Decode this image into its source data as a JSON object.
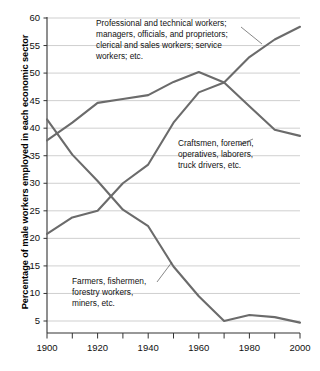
{
  "chart_data": {
    "type": "line",
    "title": "",
    "subtitle": "",
    "xlabel": "",
    "ylabel": "Percentage of male workers employed in each economic sector",
    "xlim": [
      1900,
      2000
    ],
    "ylim": [
      0,
      60
    ],
    "grid": true,
    "legend_position": "inline-annotations",
    "x": [
      1900,
      1910,
      1920,
      1930,
      1940,
      1950,
      1960,
      1970,
      1980,
      1990,
      2000
    ],
    "xticks": [
      1900,
      1920,
      1940,
      1960,
      1980,
      2000
    ],
    "xtick_labels": [
      "1900",
      "1920",
      "1940",
      "1960",
      "1980",
      "2000"
    ],
    "xminor_ticks": [
      1910,
      1930,
      1950,
      1970,
      1990
    ],
    "yticks": [
      5,
      10,
      15,
      20,
      25,
      30,
      35,
      40,
      45,
      50,
      55,
      60
    ],
    "ytick_labels": [
      "5",
      "10",
      "15",
      "20",
      "25",
      "30",
      "35",
      "40",
      "45",
      "50",
      "55",
      "60"
    ],
    "line_color": "#6b6b6b",
    "grid_color": "#c9c9c9",
    "axis_color": "#333333",
    "series": [
      {
        "name": "white-collar",
        "label": "Professional and technical workers;\nmanagers, officials, and proprietors;\nclerical and sales workers; service\nworkers; etc.",
        "values": [
          20.8,
          23.8,
          25.0,
          30.0,
          33.4,
          41.0,
          46.5,
          48.3,
          52.9,
          56.1,
          58.4
        ]
      },
      {
        "name": "blue-collar",
        "label": "Craftsmen, foremen,\noperatives, laborers,\ntruck drivers, etc.",
        "values": [
          37.8,
          41.0,
          44.6,
          45.3,
          46.0,
          48.4,
          50.2,
          48.3,
          44.0,
          39.7,
          38.6
        ]
      },
      {
        "name": "farm",
        "label": "Farmers, fishermen,\nforestry workers,\nminers, etc.",
        "values": [
          41.6,
          35.2,
          30.4,
          25.2,
          22.2,
          14.9,
          9.5,
          5.0,
          6.1,
          5.7,
          4.7
        ]
      }
    ]
  },
  "axis": {
    "y_title": "Percentage of male workers employed in each economic sector"
  },
  "annotations": {
    "professional": "Professional and technical workers;\nmanagers, officials, and proprietors;\nclerical and sales workers; service\nworkers; etc.",
    "craftsmen": "Craftsmen, foremen,\noperatives, laborers,\ntruck drivers, etc.",
    "farmers": "Farmers, fishermen,\nforestry workers,\nminers, etc."
  }
}
